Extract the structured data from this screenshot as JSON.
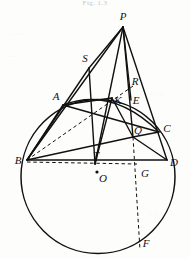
{
  "figure": {
    "caption": "Fig. 1.3",
    "width": 190,
    "height": 259,
    "ink_color": "#111111",
    "paper_color": "#fdfdfc",
    "bleed_color": "#ececea"
  },
  "circle": {
    "label": "main-circle",
    "cx": 98,
    "cy": 176.5,
    "r": 77
  },
  "points": [
    {
      "id": "P",
      "label": "P",
      "x": 123,
      "y": 27,
      "lx": 123,
      "ly": 16,
      "marker": false
    },
    {
      "id": "S",
      "label": "S",
      "x": 89,
      "y": 68,
      "lx": 85,
      "ly": 58,
      "marker": false
    },
    {
      "id": "A",
      "label": "A",
      "x": 63,
      "y": 105,
      "lx": 56,
      "ly": 96,
      "marker": false
    },
    {
      "id": "R",
      "label": "R",
      "x": 131,
      "y": 90,
      "lx": 135,
      "ly": 81,
      "marker": false
    },
    {
      "id": "K",
      "label": "K",
      "x": 112,
      "y": 98,
      "lx": 118,
      "ly": 100,
      "marker": false
    },
    {
      "id": "E",
      "label": "E",
      "x": 131,
      "y": 100,
      "lx": 136,
      "ly": 100,
      "marker": false
    },
    {
      "id": "Q",
      "label": "Q",
      "x": 133,
      "y": 137,
      "lx": 138,
      "ly": 130,
      "marker": false
    },
    {
      "id": "C",
      "label": "C",
      "x": 159,
      "y": 132,
      "lx": 167,
      "ly": 128,
      "marker": false
    },
    {
      "id": "B",
      "label": "B",
      "x": 27,
      "y": 160,
      "lx": 18,
      "ly": 160,
      "marker": false
    },
    {
      "id": "T",
      "label": "T",
      "x": 95,
      "y": 164,
      "lx": 96,
      "ly": 155,
      "marker": false
    },
    {
      "id": "O",
      "label": "O",
      "x": 97,
      "y": 172,
      "lx": 103,
      "ly": 178,
      "marker": true
    },
    {
      "id": "G",
      "label": "G",
      "x": 137,
      "y": 164,
      "lx": 145,
      "ly": 173,
      "marker": false
    },
    {
      "id": "D",
      "label": "D",
      "x": 167,
      "y": 160,
      "lx": 174,
      "ly": 162,
      "marker": false
    },
    {
      "id": "F",
      "label": "F",
      "x": 140,
      "y": 250,
      "lx": 146,
      "ly": 243,
      "marker": false
    }
  ],
  "solid_segments": [
    {
      "name": "segment-P-B",
      "x1": 123,
      "y1": 27,
      "x2": 27,
      "y2": 160
    },
    {
      "name": "segment-P-S",
      "x1": 123,
      "y1": 27,
      "x2": 89,
      "y2": 68
    },
    {
      "name": "segment-S-B",
      "x1": 89,
      "y1": 68,
      "x2": 27,
      "y2": 160
    },
    {
      "name": "segment-S-T",
      "x1": 89,
      "y1": 68,
      "x2": 95,
      "y2": 164
    },
    {
      "name": "segment-P-T",
      "x1": 123,
      "y1": 27,
      "x2": 95,
      "y2": 164
    },
    {
      "name": "segment-P-Q",
      "x1": 123,
      "y1": 27,
      "x2": 133,
      "y2": 137
    },
    {
      "name": "segment-P-E",
      "x1": 123,
      "y1": 27,
      "x2": 131,
      "y2": 100
    },
    {
      "name": "segment-P-D",
      "x1": 123,
      "y1": 27,
      "x2": 167,
      "y2": 160
    },
    {
      "name": "segment-A-C",
      "x1": 63,
      "y1": 105,
      "x2": 159,
      "y2": 132
    },
    {
      "name": "segment-A-B",
      "x1": 63,
      "y1": 105,
      "x2": 27,
      "y2": 160
    },
    {
      "name": "segment-B-D",
      "x1": 27,
      "y1": 160,
      "x2": 167,
      "y2": 160
    },
    {
      "name": "segment-B-Q",
      "x1": 27,
      "y1": 160,
      "x2": 133,
      "y2": 137
    },
    {
      "name": "segment-Q-C",
      "x1": 133,
      "y1": 137,
      "x2": 159,
      "y2": 132
    },
    {
      "name": "segment-Q-D",
      "x1": 133,
      "y1": 137,
      "x2": 167,
      "y2": 160
    },
    {
      "name": "segment-A-K",
      "x1": 63,
      "y1": 105,
      "x2": 112,
      "y2": 98
    },
    {
      "name": "segment-K-Q",
      "x1": 112,
      "y1": 98,
      "x2": 133,
      "y2": 137
    },
    {
      "name": "segment-K-T",
      "x1": 112,
      "y1": 98,
      "x2": 95,
      "y2": 164
    }
  ],
  "dashed_segments": [
    {
      "name": "segment-B-O-G",
      "x1": 27,
      "y1": 162,
      "x2": 137,
      "y2": 164
    },
    {
      "name": "segment-B-K-R",
      "x1": 27,
      "y1": 160,
      "x2": 133,
      "y2": 86
    },
    {
      "name": "segment-Q-G-F",
      "x1": 133,
      "y1": 137,
      "x2": 140,
      "y2": 250
    }
  ],
  "arcs": [
    {
      "name": "arc-A-K-C",
      "d": "M 63 105 Q 112 86 159 132"
    }
  ],
  "bleed_texts": [
    {
      "text": "· · ·",
      "x": 12,
      "y": 30
    },
    {
      "text": "· ·",
      "x": 8,
      "y": 52
    },
    {
      "text": "· · ·",
      "x": 150,
      "y": 90
    },
    {
      "text": "· ·",
      "x": 150,
      "y": 210
    },
    {
      "text": "· ·",
      "x": 30,
      "y": 215
    }
  ]
}
